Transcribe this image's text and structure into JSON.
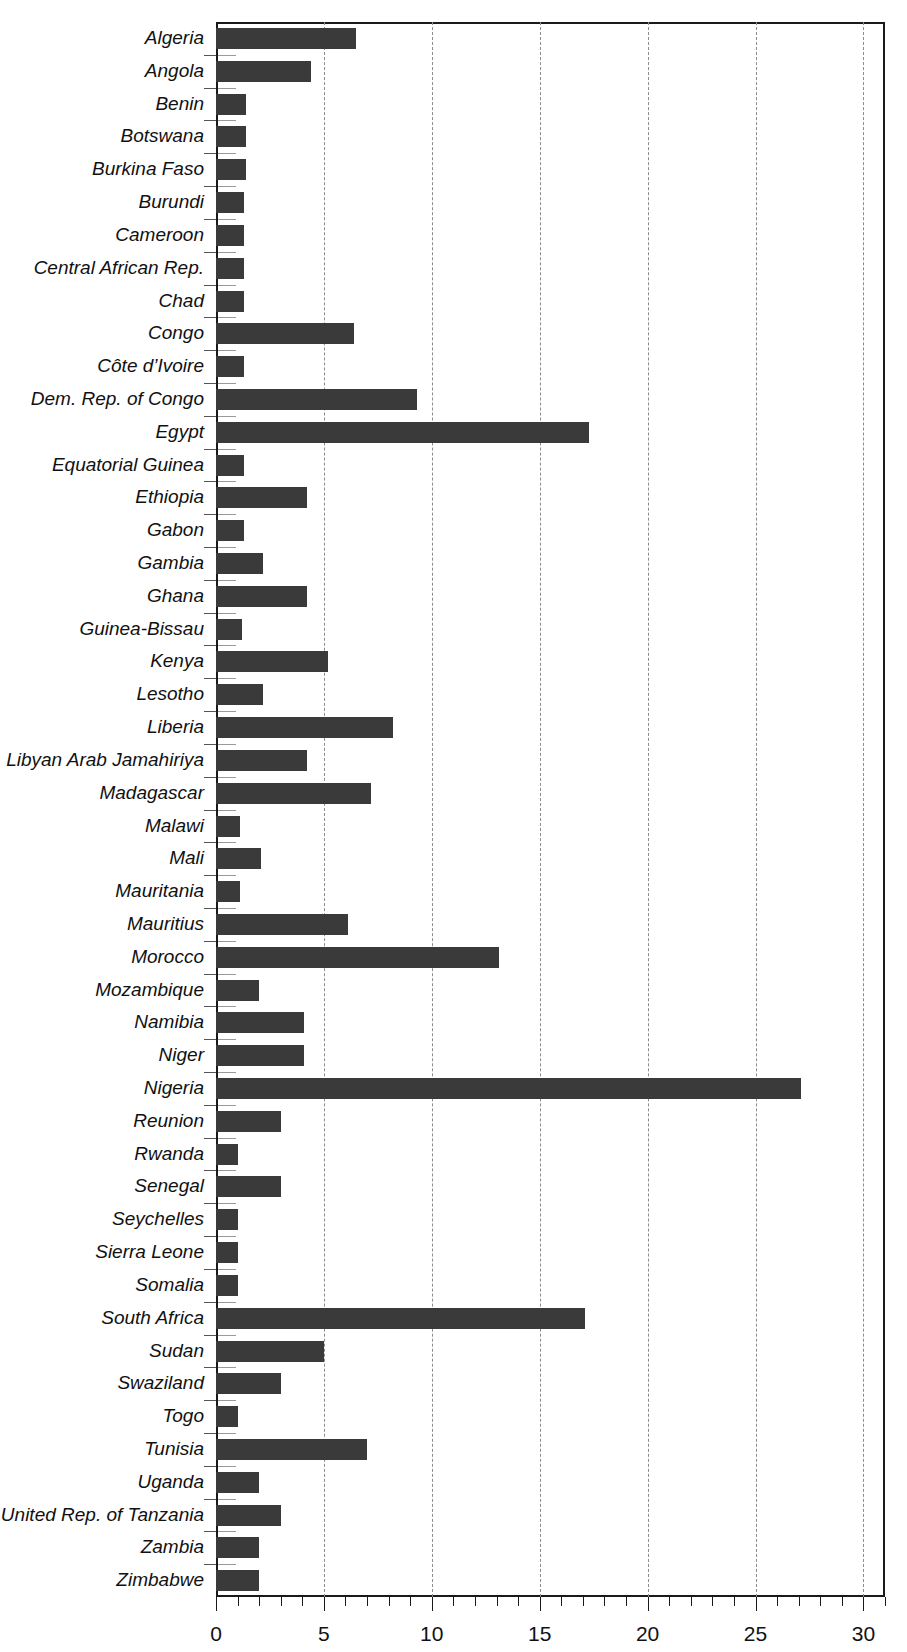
{
  "chart_data": {
    "type": "bar",
    "orientation": "horizontal",
    "title": "",
    "subtitle": "",
    "xlabel": "",
    "ylabel": "",
    "xlim": [
      0,
      31
    ],
    "xticks": [
      0,
      5,
      10,
      15,
      20,
      25,
      30
    ],
    "xtick_labels": [
      "0",
      "5",
      "10",
      "15",
      "20",
      "25",
      "30"
    ],
    "minor_tick_step": 1,
    "grid": "vertical dashed at major ticks",
    "legend": "none",
    "bar_color": "#3a3a3a",
    "categories": [
      "Algeria",
      "Angola",
      "Benin",
      "Botswana",
      "Burkina Faso",
      "Burundi",
      "Cameroon",
      "Central African Rep.",
      "Chad",
      "Congo",
      "Côte d’Ivoire",
      "Dem. Rep. of Congo",
      "Egypt",
      "Equatorial Guinea",
      "Ethiopia",
      "Gabon",
      "Gambia",
      "Ghana",
      "Guinea-Bissau",
      "Kenya",
      "Lesotho",
      "Liberia",
      "Libyan Arab Jamahiriya",
      "Madagascar",
      "Malawi",
      "Mali",
      "Mauritania",
      "Mauritius",
      "Morocco",
      "Mozambique",
      "Namibia",
      "Niger",
      "Nigeria",
      "Reunion",
      "Rwanda",
      "Senegal",
      "Seychelles",
      "Sierra Leone",
      "Somalia",
      "South Africa",
      "Sudan",
      "Swaziland",
      "Togo",
      "Tunisia",
      "Uganda",
      "United Rep. of Tanzania",
      "Zambia",
      "Zimbabwe"
    ],
    "values": [
      6.5,
      4.4,
      1.4,
      1.4,
      1.4,
      1.3,
      1.3,
      1.3,
      1.3,
      6.4,
      1.3,
      9.3,
      17.3,
      1.3,
      4.2,
      1.3,
      2.2,
      4.2,
      1.2,
      5.2,
      2.2,
      8.2,
      4.2,
      7.2,
      1.1,
      2.1,
      1.1,
      6.1,
      13.1,
      2.0,
      4.1,
      4.1,
      27.1,
      3.0,
      1.0,
      3.0,
      1.0,
      1.0,
      1.0,
      17.1,
      5.0,
      3.0,
      1.0,
      7.0,
      2.0,
      3.0,
      2.0,
      2.0
    ]
  }
}
